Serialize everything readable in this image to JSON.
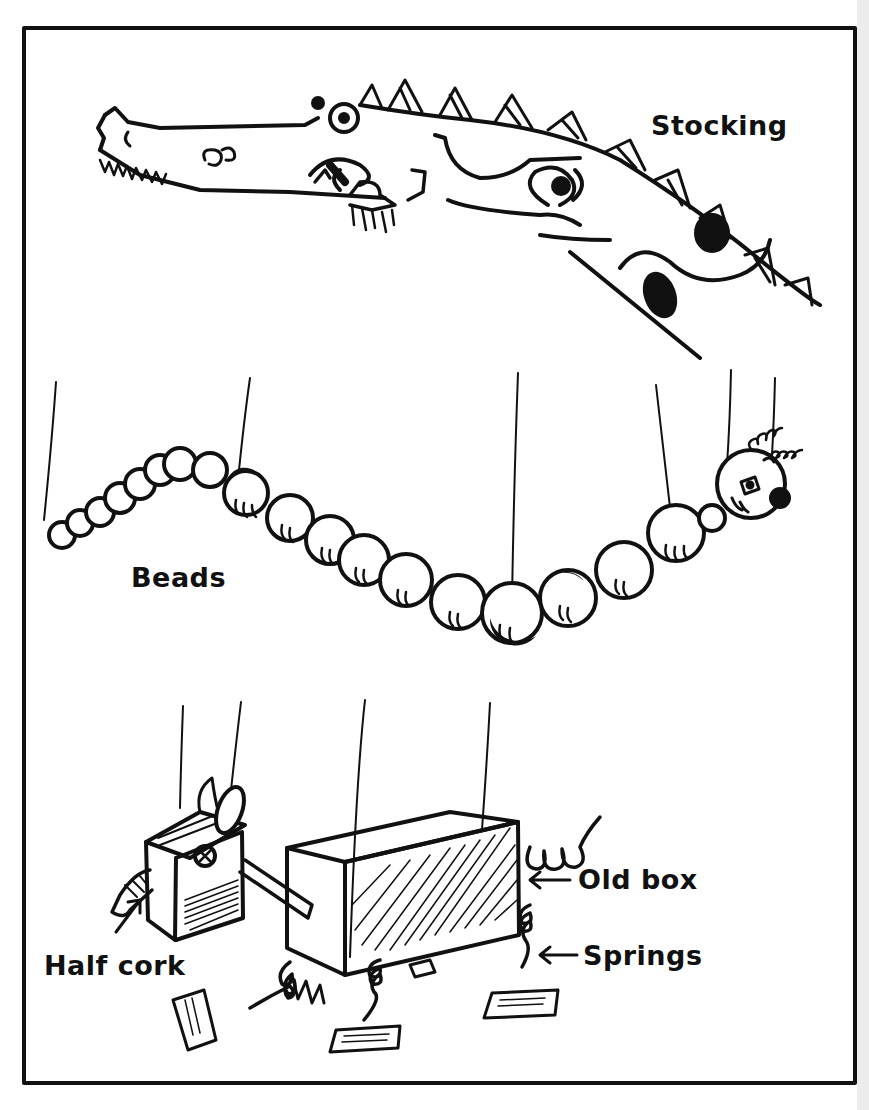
{
  "illustration": {
    "panels": [
      {
        "id": "stocking",
        "label": "Stocking",
        "subject": "crocodile puppet made from a stocking"
      },
      {
        "id": "beads",
        "label": "Beads",
        "subject": "caterpillar puppet made from strung beads"
      },
      {
        "id": "box",
        "subject": "dog puppet made from an old box",
        "annotations": [
          "Old box",
          "Springs",
          "Half cork"
        ]
      }
    ],
    "labels": {
      "stocking": "Stocking",
      "beads": "Beads",
      "old_box": "Old box",
      "springs": "Springs",
      "half_cork": "Half cork"
    },
    "arrows": {
      "old_box_arrow": "←",
      "springs_arrow": "←"
    },
    "colors": {
      "ink": "#111111",
      "paper": "#ffffff"
    }
  }
}
